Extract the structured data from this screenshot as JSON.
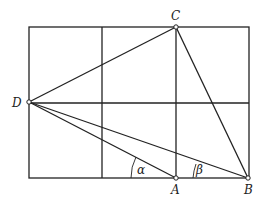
{
  "diagram": {
    "type": "geometry-grid",
    "grid": {
      "x": [
        29,
        102,
        176,
        249
      ],
      "y": [
        27,
        103,
        178
      ]
    },
    "points": {
      "A": {
        "label": "A",
        "x": 176,
        "y": 178
      },
      "B": {
        "label": "B",
        "x": 248,
        "y": 178
      },
      "C": {
        "label": "C",
        "x": 176,
        "y": 27
      },
      "D": {
        "label": "D",
        "x": 29,
        "y": 102
      }
    },
    "angles": {
      "alpha": {
        "label": "α"
      },
      "beta": {
        "label": "β"
      }
    },
    "line_color": "#222222"
  }
}
